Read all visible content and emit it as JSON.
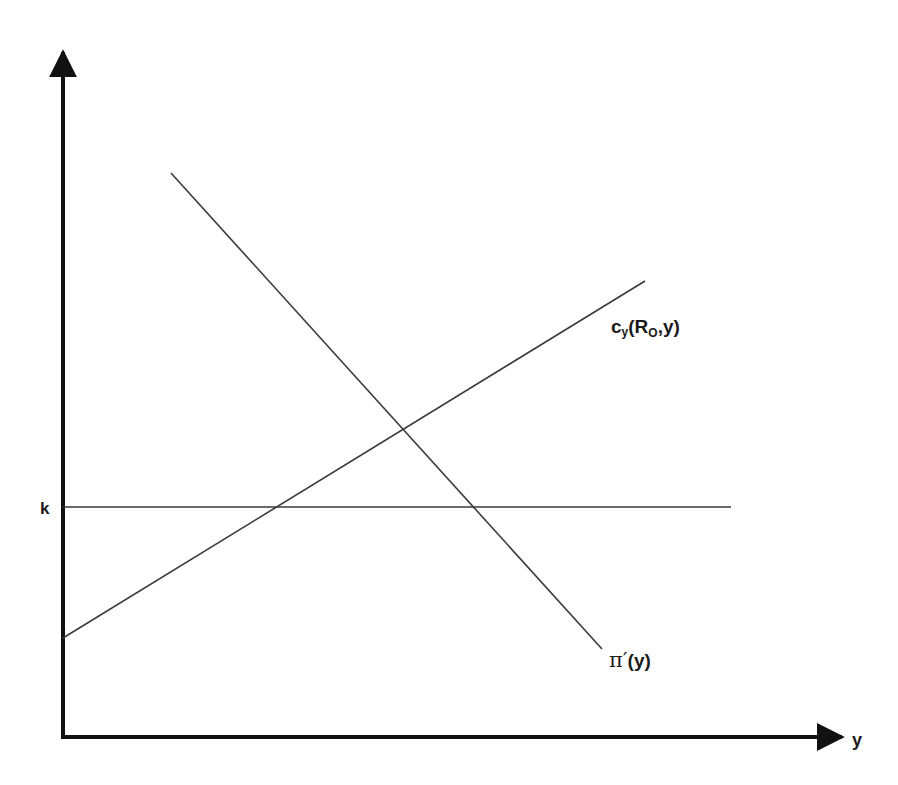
{
  "diagram": {
    "type": "economics-graph",
    "axes": {
      "x_label": "y",
      "y_label": ""
    },
    "curves": [
      {
        "id": "k",
        "label": "k",
        "kind": "horizontal-line"
      },
      {
        "id": "cy",
        "label_main": "c",
        "label_sub": "y",
        "label_args_open": "(R",
        "label_args_sub": "O",
        "label_args_close": ",y)",
        "kind": "upward-sloping-line"
      },
      {
        "id": "pi",
        "label_main": "π′",
        "label_args": "(y)",
        "kind": "downward-sloping-line"
      }
    ],
    "colors": {
      "axis": "#111111",
      "line": "#3a3a3a",
      "text": "#1a1a1a"
    }
  }
}
